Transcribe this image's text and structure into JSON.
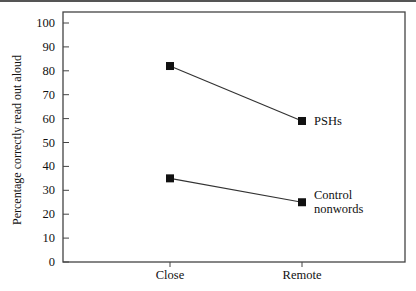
{
  "chart_data": {
    "type": "line",
    "title": "",
    "xlabel": "",
    "ylabel": "Percentage correctly read out aloud",
    "categories": [
      "Close",
      "Remote"
    ],
    "yticks": [
      0,
      10,
      20,
      30,
      40,
      50,
      60,
      70,
      80,
      90,
      100
    ],
    "ylim": [
      0,
      100
    ],
    "grid": false,
    "legend": "direct labels at line ends",
    "series": [
      {
        "name": "PSHs",
        "label_lines": [
          "PSHs"
        ],
        "values": [
          82,
          59
        ],
        "marker": "square",
        "color": "#111111"
      },
      {
        "name": "Control nonwords",
        "label_lines": [
          "Control",
          "nonwords"
        ],
        "values": [
          35,
          25
        ],
        "marker": "square",
        "color": "#111111"
      }
    ]
  }
}
